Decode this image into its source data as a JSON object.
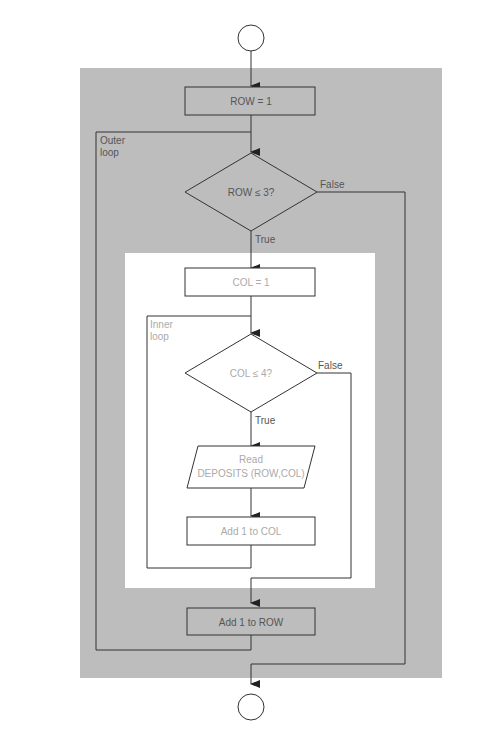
{
  "colors": {
    "outer_bg": "#bdbdbd",
    "inner_bg": "#ffffff",
    "line": "#333333"
  },
  "nodes": {
    "start": "",
    "row_init": "ROW = 1",
    "outer_cond": "ROW ≤ 3?",
    "col_init": "COL = 1",
    "inner_cond": "COL ≤ 4?",
    "read_line1": "Read",
    "read_line2": "DEPOSITS (ROW,COL)",
    "add_col": "Add 1 to COL",
    "add_row": "Add 1 to ROW",
    "end": ""
  },
  "labels": {
    "outer_true": "True",
    "outer_false": "False",
    "inner_true": "True",
    "inner_false": "False",
    "outer_loop_1": "Outer",
    "outer_loop_2": "loop",
    "inner_loop_1": "Inner",
    "inner_loop_2": "loop"
  }
}
